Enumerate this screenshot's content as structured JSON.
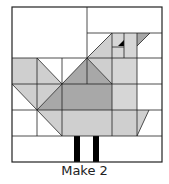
{
  "diagram": {
    "type": "quilt-block",
    "caption": "Make 2",
    "colors": {
      "background": "#ffffff",
      "light_gray": "#cfcfcf",
      "medium_gray": "#a8a8a8",
      "head_gray": "#d6d6d6",
      "line": "#222222",
      "legs": "#000000",
      "eye": "#000000"
    }
  }
}
